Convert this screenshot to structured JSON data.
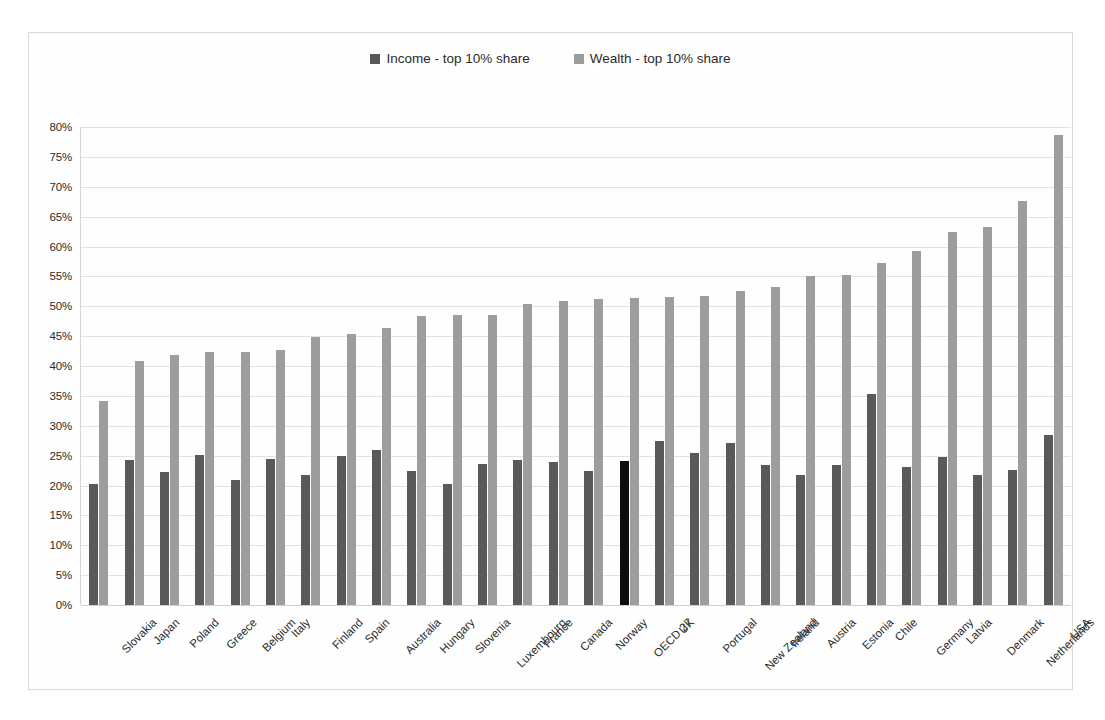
{
  "chart_data": {
    "type": "bar",
    "title": "",
    "xlabel": "",
    "ylabel": "",
    "ylim": [
      0,
      80
    ],
    "ytick_labels": [
      "80%",
      "75%",
      "70%",
      "65%",
      "60%",
      "55%",
      "50%",
      "45%",
      "40%",
      "35%",
      "30%",
      "25%",
      "20%",
      "15%",
      "10%",
      "5%",
      "0%"
    ],
    "ytick_values": [
      80,
      75,
      70,
      65,
      60,
      55,
      50,
      45,
      40,
      35,
      30,
      25,
      20,
      15,
      10,
      5,
      0
    ],
    "grid": true,
    "legend_position": "top-center",
    "categories": [
      "Slovakia",
      "Japan",
      "Poland",
      "Greece",
      "Belgium",
      "Italy",
      "Finland",
      "Spain",
      "Australia",
      "Hungary",
      "Slovenia",
      "Luxembourg",
      "France",
      "Canada",
      "Norway",
      "OECD 27",
      "UK",
      "Portugal",
      "New Zealand",
      "Ireland",
      "Austria",
      "Estonia",
      "Chile",
      "Germany",
      "Latvia",
      "Denmark",
      "Netherlands",
      "USA"
    ],
    "highlight_category": "OECD 27",
    "series": [
      {
        "name": "Income - top 10% share",
        "color": "#595959",
        "highlight_color": "#0d0d0d",
        "values": [
          20.3,
          24.2,
          22.3,
          25.1,
          21.0,
          24.4,
          21.7,
          25.0,
          25.9,
          22.4,
          20.2,
          23.6,
          24.3,
          23.9,
          22.4,
          24.1,
          27.4,
          25.4,
          27.1,
          23.4,
          21.8,
          23.4,
          35.4,
          23.1,
          24.7,
          21.8,
          22.6,
          28.4
        ]
      },
      {
        "name": "Wealth - top 10% share",
        "color": "#9d9d9d",
        "values": [
          34.2,
          40.9,
          41.8,
          42.3,
          42.4,
          42.6,
          44.9,
          45.4,
          46.4,
          48.4,
          48.5,
          48.5,
          50.3,
          50.8,
          51.2,
          51.4,
          51.6,
          51.8,
          52.5,
          53.2,
          55.0,
          55.2,
          57.3,
          59.2,
          62.5,
          63.2,
          67.6,
          78.7
        ]
      }
    ]
  },
  "legend": {
    "items": [
      {
        "label": "Income - top 10% share",
        "swatch": "#595959"
      },
      {
        "label": "Wealth - top 10% share",
        "swatch": "#9d9d9d"
      }
    ]
  },
  "colors": {
    "income": "#595959",
    "income_highlight": "#0d0d0d",
    "wealth": "#9d9d9d",
    "gridline": "#e2e2e2",
    "frame_border": "#d9d9d9",
    "text": "#2b2b2b",
    "background": "#ffffff"
  }
}
